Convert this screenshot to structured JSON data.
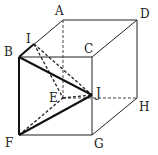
{
  "diagram": {
    "type": "cube",
    "vertices": {
      "A": {
        "label": "A",
        "x": 63,
        "y": 20
      },
      "B": {
        "label": "B",
        "x": 19,
        "y": 57
      },
      "C": {
        "label": "C",
        "x": 92,
        "y": 57
      },
      "D": {
        "label": "D",
        "x": 137,
        "y": 20
      },
      "E": {
        "label": "E",
        "x": 63,
        "y": 98
      },
      "F": {
        "label": "F",
        "x": 19,
        "y": 135
      },
      "G": {
        "label": "G",
        "x": 92,
        "y": 135
      },
      "H": {
        "label": "H",
        "x": 137,
        "y": 98
      },
      "I": {
        "label": "I",
        "x": 34,
        "y": 44
      },
      "J": {
        "label": "J",
        "x": 92,
        "y": 95
      }
    },
    "solid_edges": [
      "AD",
      "AB",
      "BC",
      "DC",
      "DH",
      "BF",
      "CG",
      "FG",
      "GH"
    ],
    "hidden_edges": [
      "AE",
      "EH",
      "EF"
    ],
    "bold_segments": [
      "BJ",
      "JF",
      "BF"
    ],
    "dashed_segments": [
      "IJ",
      "IE",
      "EJ",
      "FJ"
    ]
  }
}
